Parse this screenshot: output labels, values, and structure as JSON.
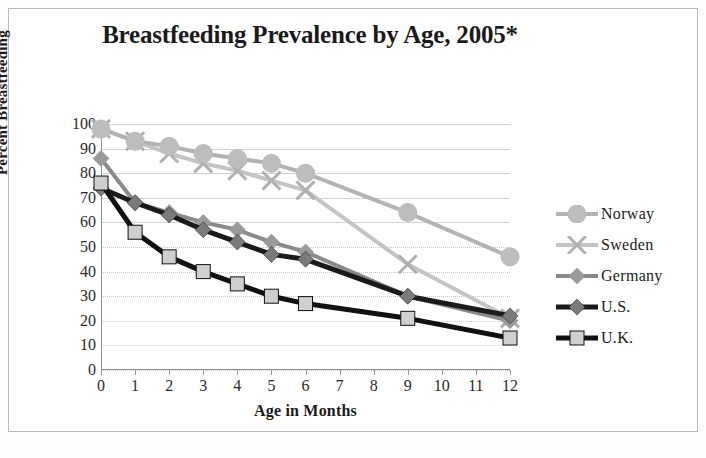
{
  "chart_data": {
    "type": "line",
    "title": "Breastfeeding Prevalence by Age, 2005*",
    "xlabel": "Age in Months",
    "ylabel": "Percent Breastfeeding",
    "x": [
      0,
      1,
      2,
      3,
      4,
      5,
      6,
      9,
      12
    ],
    "xtick_labels": [
      "0",
      "1",
      "2",
      "3",
      "4",
      "5",
      "6",
      "7",
      "8",
      "9",
      "10",
      "11",
      "12"
    ],
    "ytick_labels": [
      "0",
      "10",
      "20",
      "30",
      "40",
      "50",
      "60",
      "70",
      "80",
      "90",
      "100"
    ],
    "xlim": [
      0,
      12
    ],
    "ylim": [
      0,
      100
    ],
    "grid": true,
    "legend_position": "right",
    "series": [
      {
        "name": "Norway",
        "color": "#b3b3b3",
        "marker": "diamond",
        "marker_fill": "#bdbdbd",
        "values": [
          98,
          93,
          91,
          88,
          86,
          84,
          80,
          64,
          46
        ]
      },
      {
        "name": "Sweden",
        "color": "#c4c4c4",
        "marker": "cross",
        "marker_fill": "#b0b0b0",
        "values": [
          98,
          93,
          88,
          84,
          81,
          77,
          73,
          43,
          21
        ]
      },
      {
        "name": "Germany",
        "color": "#8a8a8a",
        "marker": "diamond",
        "marker_fill": "#9a9a9a",
        "values": [
          86,
          68,
          64,
          60,
          57,
          52,
          48,
          30,
          20
        ]
      },
      {
        "name": "U.S.",
        "color": "#1a1a1a",
        "marker": "diamond",
        "marker_fill": "#7a7a7a",
        "values": [
          74,
          68,
          63,
          57,
          52,
          47,
          45,
          30,
          22
        ]
      },
      {
        "name": "U.K.",
        "color": "#111111",
        "marker": "square",
        "marker_fill": "#cfcfcf",
        "values": [
          76,
          56,
          46,
          40,
          35,
          30,
          27,
          21,
          13
        ]
      }
    ]
  }
}
